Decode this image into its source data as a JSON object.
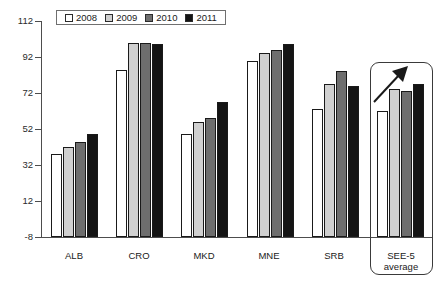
{
  "chart_data": {
    "type": "bar",
    "title": "",
    "subtitle": "",
    "xlabel": "",
    "ylabel": "",
    "ylim": [
      -8,
      112
    ],
    "yticks": [
      -8,
      12,
      32,
      52,
      72,
      92,
      112
    ],
    "grid": false,
    "legend_position": "top-left",
    "categories": [
      "ALB",
      "CRO",
      "MKD",
      "MNE",
      "SRB",
      "SEE-5 average"
    ],
    "series": [
      {
        "name": "2008",
        "color": "#ffffff",
        "values": [
          38,
          85,
          49,
          90,
          63,
          62
        ]
      },
      {
        "name": "2009",
        "color": "#d0d0d0",
        "values": [
          42,
          100,
          56,
          94,
          77,
          74
        ]
      },
      {
        "name": "2010",
        "color": "#6e6e6e",
        "values": [
          45,
          100,
          58,
          96,
          84,
          73
        ]
      },
      {
        "name": "2011",
        "color": "#141414",
        "values": [
          49,
          99,
          67,
          99,
          76,
          77
        ]
      }
    ],
    "annotations": [
      {
        "name": "upward-trend-arrow",
        "target": "SEE-5 average",
        "direction": "up-right"
      },
      {
        "name": "highlight-box",
        "target": "SEE-5 average"
      }
    ]
  },
  "legend": {
    "items": [
      {
        "label": "2008",
        "color": "#ffffff"
      },
      {
        "label": "2009",
        "color": "#d0d0d0"
      },
      {
        "label": "2010",
        "color": "#6e6e6e"
      },
      {
        "label": "2011",
        "color": "#141414"
      }
    ]
  },
  "axis": {
    "y_tick_labels": [
      "112",
      "92",
      "72",
      "52",
      "32",
      "12",
      "-8"
    ]
  },
  "categories": {
    "labels": [
      "ALB",
      "CRO",
      "MKD",
      "MNE",
      "SRB",
      "SEE-5"
    ],
    "see5_second_line": "average"
  }
}
